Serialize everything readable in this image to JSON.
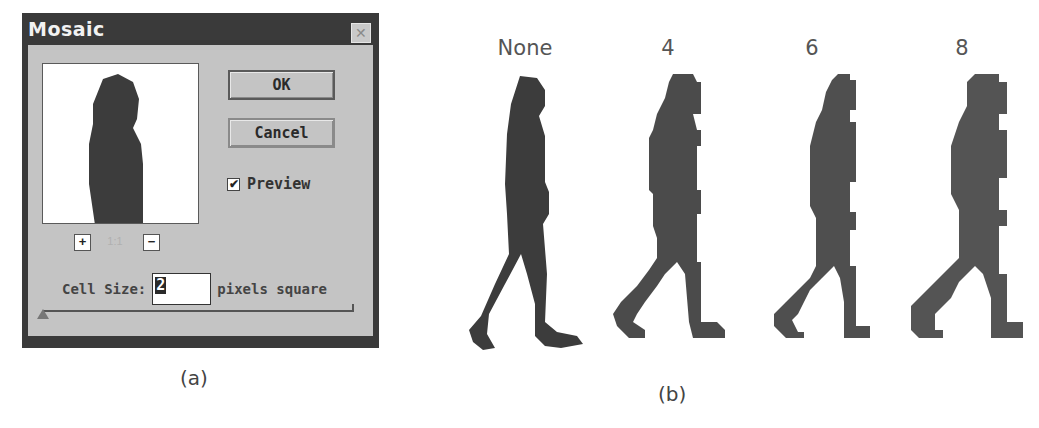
{
  "dialog": {
    "title": "Mosaic",
    "close_icon": "close-box-icon",
    "buttons": {
      "ok": "OK",
      "cancel": "Cancel"
    },
    "preview_checkbox": {
      "label": "Preview",
      "checked": true,
      "check_glyph": "✔"
    },
    "zoom": {
      "in_label": "+",
      "out_label": "−",
      "level": "1:1"
    },
    "cell_size": {
      "label": "Cell Size:",
      "value": "2",
      "unit": "pixels square"
    },
    "slider": {
      "min_position": 0
    }
  },
  "panel_b": {
    "labels": [
      "None",
      "4",
      "6",
      "8"
    ]
  },
  "captions": {
    "a": "(a)",
    "b": "(b)"
  },
  "colors": {
    "dialog_frame": "#3a3a3a",
    "dialog_face": "#c4c4c4",
    "silhouette": "#3c3c3c"
  }
}
